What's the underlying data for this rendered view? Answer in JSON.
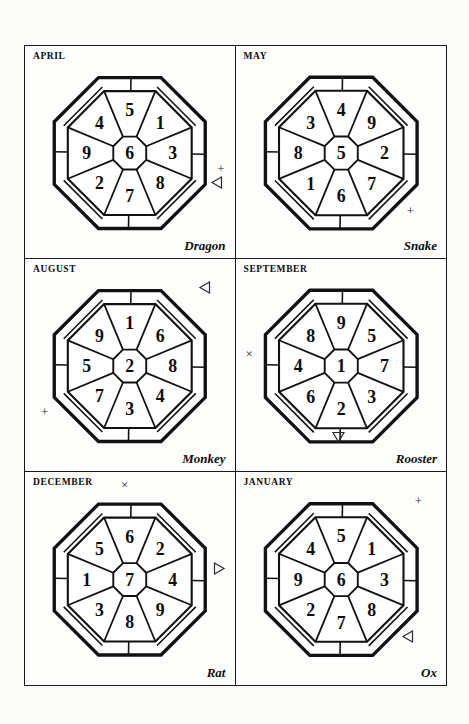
{
  "page": {
    "background_color": "#fbfbfa",
    "paper_color": "#fdfdfc",
    "ink_color": "#111111",
    "border_color": "#1a1a1a"
  },
  "panels": [
    {
      "id": "april",
      "month": "APRIL",
      "animal": "Dragon",
      "cells": {
        "center": "6",
        "north": "1",
        "northeast": "3",
        "east": "8",
        "southeast": "7",
        "south": "2",
        "southwest": "9",
        "west": "4",
        "northwest": "5"
      },
      "markers": [
        {
          "glyph": "+",
          "name": "plus-marker",
          "position": "right-lower"
        },
        {
          "glyph": "triangle-left",
          "name": "triangle-left-marker",
          "position": "right-lower-below"
        }
      ]
    },
    {
      "id": "may",
      "month": "MAY",
      "animal": "Snake",
      "cells": {
        "center": "5",
        "north": "9",
        "northeast": "2",
        "east": "7",
        "southeast": "6",
        "south": "1",
        "southwest": "8",
        "west": "3",
        "northwest": "4"
      },
      "markers": [
        {
          "glyph": "+",
          "name": "plus-marker",
          "position": "bottom-right"
        }
      ]
    },
    {
      "id": "august",
      "month": "AUGUST",
      "animal": "Monkey",
      "cells": {
        "center": "2",
        "north": "6",
        "northeast": "8",
        "east": "4",
        "southeast": "3",
        "south": "7",
        "southwest": "5",
        "west": "9",
        "northwest": "1"
      },
      "markers": [
        {
          "glyph": "triangle-left",
          "name": "triangle-left-marker",
          "position": "top-right"
        },
        {
          "glyph": "+",
          "name": "plus-marker",
          "position": "bottom-left"
        }
      ]
    },
    {
      "id": "september",
      "month": "SEPTEMBER",
      "animal": "Rooster",
      "cells": {
        "center": "1",
        "north": "5",
        "northeast": "7",
        "east": "3",
        "southeast": "2",
        "south": "6",
        "southwest": "4",
        "west": "8",
        "northwest": "9"
      },
      "markers": [
        {
          "glyph": "×",
          "name": "cross-marker",
          "position": "left-middle"
        },
        {
          "glyph": "triangle-down",
          "name": "triangle-down-marker",
          "position": "bottom-center"
        }
      ]
    },
    {
      "id": "december",
      "month": "DECEMBER",
      "animal": "Rat",
      "cells": {
        "center": "7",
        "north": "2",
        "northeast": "4",
        "east": "9",
        "southeast": "8",
        "south": "3",
        "southwest": "1",
        "west": "5",
        "northwest": "6"
      },
      "markers": [
        {
          "glyph": "×",
          "name": "cross-marker",
          "position": "top-center"
        },
        {
          "glyph": "triangle-right",
          "name": "triangle-right-marker",
          "position": "right-middle"
        }
      ]
    },
    {
      "id": "january",
      "month": "JANUARY",
      "animal": "Ox",
      "cells": {
        "center": "6",
        "north": "1",
        "northeast": "3",
        "east": "8",
        "southeast": "7",
        "south": "2",
        "southwest": "9",
        "west": "4",
        "northwest": "5"
      },
      "markers": [
        {
          "glyph": "+",
          "name": "plus-marker",
          "position": "top-right"
        },
        {
          "glyph": "triangle-left",
          "name": "triangle-left-marker",
          "position": "bottom-right"
        }
      ]
    }
  ]
}
